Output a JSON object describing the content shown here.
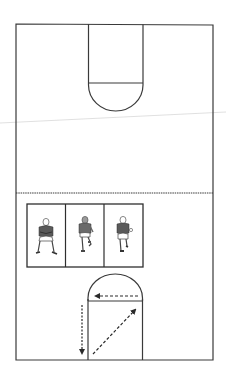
{
  "diagram": {
    "colors": {
      "line": "#3a3a3a",
      "background": "#ffffff",
      "artifact": "#d8d8d8",
      "figure_dark": "#4a4a4a"
    },
    "court": {
      "left": 16,
      "top": 24,
      "right": 213,
      "bottom": 360,
      "halfcourt_y": 193,
      "top_key": {
        "left": 88,
        "right": 143,
        "line_y": 83,
        "arc_bottom_y": 111
      },
      "bottom_key": {
        "left": 88,
        "right": 142,
        "line_y": 301,
        "arc_top_y": 274
      }
    },
    "player_panel": {
      "label": "Player stance sequence",
      "left": 27,
      "top": 204,
      "right": 143,
      "bottom": 267,
      "frames": [
        {
          "name": "defensive-stance",
          "description": "Player in defensive stance"
        },
        {
          "name": "drop-step",
          "description": "Player turning / drop step"
        },
        {
          "name": "sprint",
          "description": "Player running forward"
        }
      ]
    },
    "arrows": [
      {
        "name": "lane-line-arrow",
        "description": "Dashed arrow along free-throw line pointing left"
      },
      {
        "name": "sideline-down-arrow",
        "description": "Dashed arrow down outside left of lane"
      },
      {
        "name": "diagonal-arrow",
        "description": "Dashed diagonal arrow from bottom-left to top-right of lane"
      }
    ]
  }
}
